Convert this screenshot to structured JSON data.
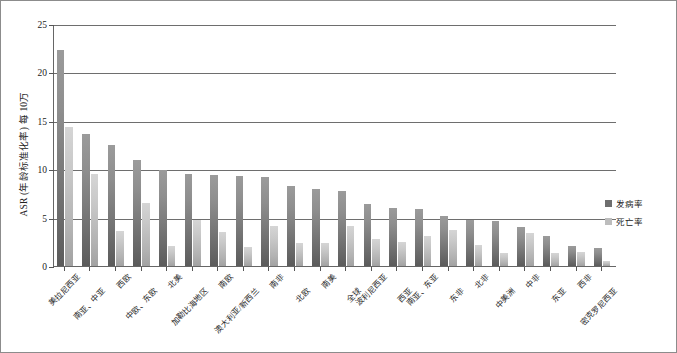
{
  "chart_data": {
    "type": "bar",
    "title": "",
    "xlabel": "",
    "ylabel": "ASR (年龄标准化率) 每 10万",
    "ylim": [
      0,
      25
    ],
    "yticks": [
      0,
      5,
      10,
      15,
      20,
      25
    ],
    "grid": true,
    "legend_position": "right",
    "categories": [
      "美拉尼西亚",
      "南亚、中亚",
      "西欧",
      "中欧、东欧",
      "北美",
      "加勒比海地区",
      "南欧",
      "澳大利亚/新西兰",
      "南非",
      "北欧",
      "南美",
      "全球",
      "波利尼西亚",
      "西亚",
      "南亚、东亚",
      "东非",
      "北非",
      "中美洲",
      "中非",
      "东亚",
      "西非",
      "密克罗尼西亚"
    ],
    "series": [
      {
        "name": "发病率",
        "color": "#6e6e6e",
        "values": [
          22.3,
          13.6,
          12.5,
          11.0,
          9.9,
          9.5,
          9.4,
          9.3,
          9.2,
          8.3,
          8.0,
          7.8,
          6.4,
          6.0,
          5.9,
          5.2,
          4.8,
          4.6,
          4.0,
          3.1,
          2.1,
          1.9
        ]
      },
      {
        "name": "死亡率",
        "color": "#bdbdbd",
        "values": [
          14.4,
          9.5,
          3.6,
          6.5,
          2.1,
          4.8,
          3.5,
          2.0,
          4.1,
          2.4,
          2.4,
          4.1,
          2.8,
          2.5,
          3.1,
          3.7,
          2.2,
          1.3,
          3.4,
          1.3,
          1.4,
          0.5
        ]
      }
    ]
  },
  "legend": {
    "incidence_label": "发病率",
    "mortality_label": "死亡率"
  },
  "axis": {
    "y_title": "ASR (年龄标准化率) 每 10万"
  }
}
